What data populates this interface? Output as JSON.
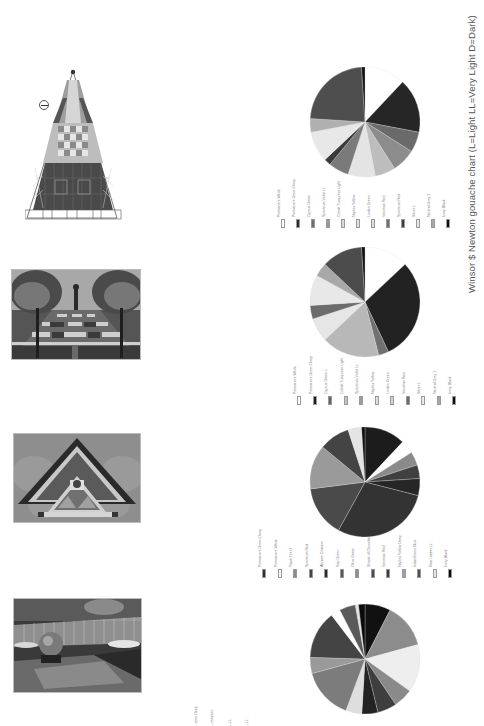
{
  "page": {
    "orientation": "rotated-90-clockwise",
    "caption": "Winsor $ Newton gouache chart (L=Light  LL=Very Light  D=Dark)"
  },
  "figures": [
    {
      "id": "plan-drawing",
      "description": "Triangular garden plan with checkerboard pattern and north arrow"
    },
    {
      "id": "photo-garden-trees",
      "description": "Garden path with trees and checkerboard planting beds"
    },
    {
      "id": "photo-triangular-gable",
      "description": "Ornate triangular gable with decorative fretwork"
    },
    {
      "id": "photo-sphere-fountain",
      "description": "Sphere sculpture fountain with grid fence"
    }
  ],
  "chart_data": [
    {
      "type": "pie",
      "title": "Chart 1",
      "legend": [
        "Permanent White",
        "Permanent Green Deep",
        "Cyprus Green",
        "Spectrum Violet LL",
        "Cobalt Turquoise Light",
        "Naples Yellow",
        "Linden Green",
        "Venetian Red",
        "Spectrum Red",
        "Silver L",
        "Neutral Grey 1",
        "Ivory Black"
      ],
      "legend_colors": [
        "#ffffff",
        "#2a2a2a",
        "#6e6e6e",
        "#9a9a9a",
        "#d8d8d8",
        "#e2e2e2",
        "#dcdcdc",
        "#707070",
        "#3c3c3c",
        "#e8e8e8",
        "#a8a8a8",
        "#111111"
      ],
      "slices": [
        {
          "color": "#ffffff",
          "value": 12
        },
        {
          "color": "#262626",
          "value": 16
        },
        {
          "color": "#6a6a6a",
          "value": 6
        },
        {
          "color": "#8c8c8c",
          "value": 7
        },
        {
          "color": "#bdbdbd",
          "value": 6
        },
        {
          "color": "#e4e4e4",
          "value": 8
        },
        {
          "color": "#7a7a7a",
          "value": 6
        },
        {
          "color": "#3a3a3a",
          "value": 2
        },
        {
          "color": "#e8e8e8",
          "value": 9
        },
        {
          "color": "#b0b0b0",
          "value": 4
        },
        {
          "color": "#4e4e4e",
          "value": 23
        },
        {
          "color": "#111111",
          "value": 1
        }
      ]
    },
    {
      "type": "pie",
      "title": "Chart 2",
      "legend": [
        "Permanent White",
        "Permanent Green Deep",
        "Cyprus Green L",
        "Cobalt Turquoise Light",
        "Spectrum Violet LL",
        "Naples Yellow",
        "Linden Green",
        "Venetian Red",
        "Silver L",
        "Neutral Grey 1",
        "Ivory Black"
      ],
      "legend_colors": [
        "#ffffff",
        "#1e1e1e",
        "#666666",
        "#c4c4c4",
        "#9c9c9c",
        "#e0e0e0",
        "#d4d4d4",
        "#6a6a6a",
        "#ececec",
        "#a6a6a6",
        "#0e0e0e"
      ],
      "slices": [
        {
          "color": "#ffffff",
          "value": 13
        },
        {
          "color": "#222222",
          "value": 30
        },
        {
          "color": "#707070",
          "value": 3
        },
        {
          "color": "#b8b8b8",
          "value": 17
        },
        {
          "color": "#e6e6e6",
          "value": 7
        },
        {
          "color": "#6c6c6c",
          "value": 4
        },
        {
          "color": "#e8e8e8",
          "value": 9
        },
        {
          "color": "#a8a8a8",
          "value": 4
        },
        {
          "color": "#4c4c4c",
          "value": 12
        },
        {
          "color": "#111111",
          "value": 1
        }
      ]
    },
    {
      "type": "pie",
      "title": "Chart 3",
      "legend": [
        "Permanent Green Deep",
        "Permanent White",
        "Flash Tint D",
        "Spectrum Red",
        "Alizarin Crimson",
        "Sap Green",
        "Olive Green",
        "Shade of Chocolate",
        "Venetian Red",
        "Naples Yellow Deep",
        "Indanthrene Blue",
        "Raw Umber LL",
        "Ivory Black"
      ],
      "legend_colors": [
        "#2e2e2e",
        "#ffffff",
        "#8a8a8a",
        "#444444",
        "#2a2a2a",
        "#555555",
        "#8e8e8e",
        "#4a4a4a",
        "#3a3a3a",
        "#a0a0a0",
        "#4c4c4c",
        "#e6e6e6",
        "#0a0a0a"
      ],
      "slices": [
        {
          "color": "#1c1c1c",
          "value": 12
        },
        {
          "color": "#ffffff",
          "value": 4
        },
        {
          "color": "#8a8a8a",
          "value": 4
        },
        {
          "color": "#404040",
          "value": 4
        },
        {
          "color": "#262626",
          "value": 5
        },
        {
          "color": "#333333",
          "value": 29
        },
        {
          "color": "#4a4a4a",
          "value": 15
        },
        {
          "color": "#9a9a9a",
          "value": 13
        },
        {
          "color": "#444444",
          "value": 9
        },
        {
          "color": "#e4e4e4",
          "value": 4
        },
        {
          "color": "#0e0e0e",
          "value": 1
        }
      ]
    },
    {
      "type": "pie",
      "title": "Chart 4",
      "legend": [
        "Permanent Green Deep",
        "Permanent White",
        "Flash Tint D",
        "Spectrum Red",
        "Alizarin Crimson",
        "Sap Green",
        "Olive Green",
        "Shade of Chocolate",
        "Venetian Red",
        "Naples Yellow Deep",
        "Indanthrene Blue",
        "Raw Umber LL",
        "Ivory Black"
      ],
      "slices": [
        {
          "color": "#111111",
          "value": 8
        },
        {
          "color": "#8c8c8c",
          "value": 14
        },
        {
          "color": "#eeeeee",
          "value": 15
        },
        {
          "color": "#8a8a8a",
          "value": 6
        },
        {
          "color": "#3e3e3e",
          "value": 6
        },
        {
          "color": "#222222",
          "value": 5
        },
        {
          "color": "#dedede",
          "value": 5
        },
        {
          "color": "#7c7c7c",
          "value": 16
        },
        {
          "color": "#9a9a9a",
          "value": 5
        },
        {
          "color": "#444444",
          "value": 15
        },
        {
          "color": "#ffffff",
          "value": 3
        },
        {
          "color": "#5a5a5a",
          "value": 5
        },
        {
          "color": "#e0e0e0",
          "value": 1
        },
        {
          "color": "#0a0a0a",
          "value": 2
        }
      ]
    }
  ],
  "legends_bottom_strip": [
    "...reen Deep",
    "...ontains L",
    "...LL",
    "...LL",
    "..."
  ]
}
